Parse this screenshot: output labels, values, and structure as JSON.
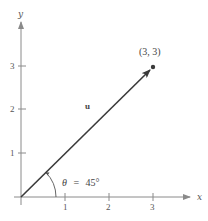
{
  "diagram": {
    "axes": {
      "x_label": "x",
      "y_label": "y",
      "x_ticks": [
        "1",
        "2",
        "3"
      ],
      "y_ticks": [
        "1",
        "2",
        "3"
      ]
    },
    "vector": {
      "name": "u",
      "from": [
        0,
        0
      ],
      "to": [
        3,
        3
      ],
      "endpoint_label": "(3, 3)"
    },
    "angle": {
      "label": "θ = 45°",
      "theta_symbol": "θ",
      "equals": "=",
      "value": "45°"
    },
    "colors": {
      "axis": "#8a8a8a",
      "vector": "#3a3a3a",
      "text": "#555555"
    }
  }
}
